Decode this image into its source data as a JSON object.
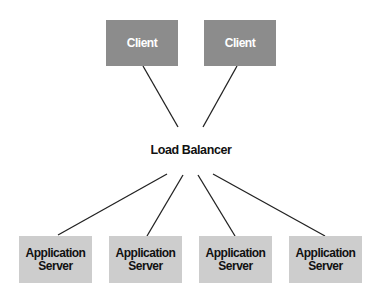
{
  "diagram": {
    "type": "network-topology",
    "clients": [
      {
        "label": "Client"
      },
      {
        "label": "Client"
      }
    ],
    "load_balancer": {
      "label": "Load Balancer"
    },
    "servers": [
      {
        "line1": "Application",
        "line2": "Server"
      },
      {
        "line1": "Application",
        "line2": "Server"
      },
      {
        "line1": "Application",
        "line2": "Server"
      },
      {
        "line1": "Application",
        "line2": "Server"
      }
    ],
    "colors": {
      "client_fill": "#8c8c8c",
      "client_text": "#ffffff",
      "server_fill": "#cdcdcd",
      "server_text": "#111111",
      "line": "#222222"
    },
    "edges": [
      {
        "from": "client-1",
        "to": "load-balancer"
      },
      {
        "from": "client-2",
        "to": "load-balancer"
      },
      {
        "from": "load-balancer",
        "to": "server-1"
      },
      {
        "from": "load-balancer",
        "to": "server-2"
      },
      {
        "from": "load-balancer",
        "to": "server-3"
      },
      {
        "from": "load-balancer",
        "to": "server-4"
      }
    ]
  }
}
